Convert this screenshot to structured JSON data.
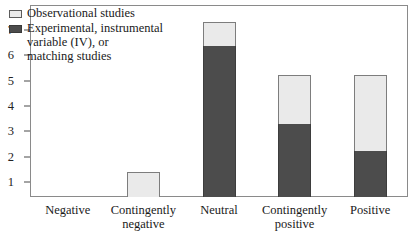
{
  "chart_data": {
    "type": "bar",
    "stacked": true,
    "title": "",
    "subtitle": "",
    "xlabel": "",
    "ylabel": "",
    "grid": false,
    "legend_position": "top-left",
    "ylim": [
      0,
      7.6
    ],
    "yticks": [
      1,
      2,
      3,
      4,
      5,
      6,
      7
    ],
    "ytick_labels": [
      "1",
      "2",
      "3",
      "4",
      "5",
      "6",
      "7"
    ],
    "categories": [
      "Negative",
      "Contingently negative",
      "Neutral",
      "Contingently positive",
      "Positive"
    ],
    "category_lines": [
      [
        "Negative"
      ],
      [
        "Contingently",
        "negative"
      ],
      [
        "Neutral"
      ],
      [
        "Contingently",
        "positive"
      ],
      [
        "Positive"
      ]
    ],
    "series": [
      {
        "name": "Experimental, instrumental variable (IV), or matching studies",
        "color": "#4c4c4c",
        "values": [
          0,
          0,
          5.95,
          2.9,
          1.8
        ]
      },
      {
        "name": "Observational studies",
        "color": "#eaeaea",
        "values": [
          0,
          1.0,
          0.95,
          1.9,
          3.0
        ]
      }
    ],
    "totals": [
      0,
      1.0,
      6.9,
      4.8,
      4.8
    ]
  },
  "legend": {
    "entries": [
      {
        "swatch": "light",
        "lines": [
          "Observational studies"
        ]
      },
      {
        "swatch": "dark",
        "lines": [
          "Experimental, instrumental",
          "variable (IV), or",
          "matching studies"
        ]
      }
    ]
  },
  "axis": {
    "y_labels": [
      "7",
      "6",
      "5",
      "4",
      "3",
      "2",
      "1"
    ],
    "x_labels": [
      [
        "Negative"
      ],
      [
        "Contingently",
        "negative"
      ],
      [
        "Neutral"
      ],
      [
        "Contingently",
        "positive"
      ],
      [
        "Positive"
      ]
    ]
  },
  "colors": {
    "observational": "#eaeaea",
    "experimental": "#4c4c4c",
    "frame": "#8a8a8a",
    "text": "#1a1a1a",
    "background": "#ffffff"
  }
}
